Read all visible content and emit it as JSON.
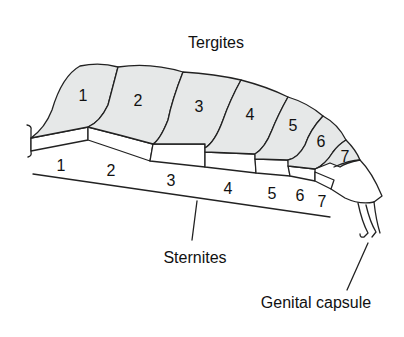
{
  "diagram": {
    "labels": {
      "tergites": "Tergites",
      "sternites": "Sternites",
      "genital_capsule": "Genital capsule"
    },
    "tergite_numbers": [
      "1",
      "2",
      "3",
      "4",
      "5",
      "6",
      "7"
    ],
    "sternite_numbers": [
      "1",
      "2",
      "3",
      "4",
      "5",
      "6",
      "7"
    ],
    "colors": {
      "tergite_fill": "#e6e8e8",
      "stroke": "#222222",
      "background": "#ffffff"
    }
  }
}
